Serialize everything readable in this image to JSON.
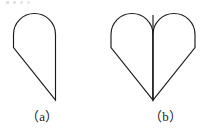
{
  "figure": {
    "caption_a": "（a）",
    "caption_b": "（b）",
    "background_color": "#ffffff",
    "stroke_color": "#1a1a1a",
    "fill_color": "#ffffff",
    "stroke_width": 1.15
  },
  "shapes": {
    "a": {
      "name": "half-heart-droplet",
      "description": "Semicircular arch on top, short vertical left side, diagonal to lower-right point, vertical right edge",
      "path": "M 13.5 34.5 L 13.5 47.5 L 55.5 100.0 L 55.5 34.5 A 21.0 21.0 0 0 0 13.5 34.5 Z",
      "bounds": {
        "x": 13,
        "y": 13,
        "width": 43,
        "height": 87
      },
      "apex_point": {
        "x": 55.5,
        "y": 100.0
      },
      "arc_radius": 21.0,
      "arc_center": {
        "x": 34.5,
        "y": 34.5
      }
    },
    "b": {
      "name": "heart-two-mirrored-halves",
      "description": "Two mirrored copies of shape (a) joined at a central vertical seam forming a heart",
      "path_left": "M 111.0 34.5 L 111.0 47.5 L 153.0 100.0 L 153.0 34.5 A 21.0 21.0 0 0 0 111.0 34.5 Z",
      "path_right": "M 195.0 34.5 L 195.0 47.5 L 153.0 100.0 L 153.0 34.5 A 21.0 21.0 0 0 1 195.0 34.5 Z",
      "seam": {
        "x1": 153.0,
        "y1": 15.0,
        "x2": 153.0,
        "y2": 100.0
      },
      "bounds": {
        "x": 111,
        "y": 13,
        "width": 84,
        "height": 87
      },
      "bottom_point": {
        "x": 153.0,
        "y": 100.0
      },
      "cusp_point": {
        "x": 153.0,
        "y": 15.0
      }
    }
  }
}
